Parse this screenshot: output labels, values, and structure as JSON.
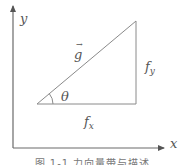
{
  "figure": {
    "axes": {
      "x_label": "x",
      "y_label": "y",
      "origin": [
        13,
        148
      ],
      "x_end": [
        168,
        148
      ],
      "y_end": [
        13,
        4
      ]
    },
    "triangle": {
      "points": [
        [
          37,
          104
        ],
        [
          136,
          104
        ],
        [
          136,
          21
        ]
      ],
      "hypotenuse_label": "g",
      "hypotenuse_arrow": "→",
      "vertical_label_base": "f",
      "vertical_label_sub": "y",
      "horizontal_label_base": "f",
      "horizontal_label_sub": "x",
      "angle_label": "θ"
    },
    "colors": {
      "line": "#8a8a8a",
      "axis": "#6a6a6a",
      "text": "#555555"
    },
    "caption": "图 1-1  力向量带与描述"
  }
}
